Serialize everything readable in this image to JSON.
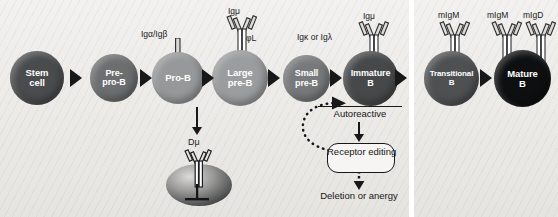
{
  "diagram": {
    "panels": [
      {
        "id": "bone-marrow",
        "name": "Bone marrow panel"
      },
      {
        "id": "periphery",
        "name": "Periphery panel"
      }
    ]
  },
  "stages": [
    {
      "id": "stem-cell",
      "label_line1": "Stem",
      "label_line2": "cell",
      "color": "#4a4b4d",
      "diameter": 54,
      "x": 10,
      "y": 51
    },
    {
      "id": "pre-pro-b",
      "label_line1": "Pre-",
      "label_line2": "pro-B",
      "color": "#6d6e70",
      "diameter": 48,
      "x": 90,
      "y": 54
    },
    {
      "id": "pro-b",
      "label_line1": "Pro-B",
      "label_line2": "",
      "color": "#96989a",
      "diameter": 52,
      "x": 152,
      "y": 52
    },
    {
      "id": "large-pre-b",
      "label_line1": "Large",
      "label_line2": "pre-B",
      "color": "#9a9c9e",
      "diameter": 56,
      "x": 212,
      "y": 50
    },
    {
      "id": "small-pre-b",
      "label_line1": "Small",
      "label_line2": "pre-B",
      "color": "#77797b",
      "diameter": 47,
      "x": 283,
      "y": 55
    },
    {
      "id": "immature-b",
      "label_line1": "Immature",
      "label_line2": "B",
      "color": "#47484a",
      "diameter": 55,
      "x": 343,
      "y": 51
    },
    {
      "id": "transitional-b",
      "label_line1": "Transitional",
      "label_line2": "B",
      "color": "#4e5052",
      "diameter": 55,
      "x": 424,
      "y": 51
    },
    {
      "id": "mature-b",
      "label_line1": "Mature",
      "label_line2": "B",
      "color": "#0e0f10",
      "diameter": 57,
      "x": 494,
      "y": 50
    }
  ],
  "receptor_labels": [
    {
      "id": "ig-alpha-beta",
      "text": "Igα/Igβ",
      "x": 141,
      "y": 29
    },
    {
      "id": "ig-mu-large",
      "text": "Igμ",
      "x": 228,
      "y": 6
    },
    {
      "id": "surrogate-light-chain",
      "text": "φL",
      "x": 244,
      "y": 33
    },
    {
      "id": "ig-kappa-lambda",
      "text": "Igκ or Igλ",
      "x": 298,
      "y": 32
    },
    {
      "id": "ig-mu-immature",
      "text": "Igμ",
      "x": 362,
      "y": 12
    },
    {
      "id": "migm-transitional",
      "text": "mIgM",
      "x": 438,
      "y": 11
    },
    {
      "id": "migm-mature",
      "text": "mIgM",
      "x": 486,
      "y": 11
    },
    {
      "id": "migd-mature",
      "text": "mIgD",
      "x": 524,
      "y": 11
    },
    {
      "id": "d-mu",
      "text": "Dμ",
      "x": 188,
      "y": 128
    }
  ],
  "flow": {
    "autoreactive": "Autoreactive",
    "receptor_editing_line1": "Receptor",
    "receptor_editing_line2": "editing",
    "outcome_line1": "Deletion or",
    "outcome_line2": "anergy"
  },
  "colors": {
    "ink": "#17181a",
    "panel_background": "#efedea",
    "page_background": "#ffffff"
  }
}
